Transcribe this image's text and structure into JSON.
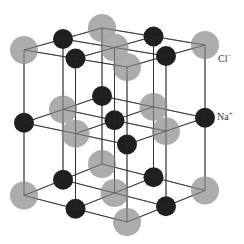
{
  "lattice": {
    "size": 3,
    "origin_back_top": [
      102,
      28
    ],
    "axis_a_left": [
      -39,
      11
    ],
    "axis_b_right": [
      51.5,
      8.5
    ],
    "axis_c_down": [
      0,
      68
    ],
    "perspective_c_extra": [
      0,
      0.035
    ]
  },
  "ions": {
    "chloride": {
      "name": "Cl",
      "charge": "−",
      "label": "Cl",
      "label_sup": "−",
      "color": "#a8a8a8",
      "radius": 14
    },
    "sodium": {
      "name": "Na",
      "charge": "+",
      "label": "Na",
      "label_sup": "+",
      "color": "#1f1f1f",
      "radius": 10
    }
  },
  "line_color": "#2a2a2a",
  "labels": {
    "cl": {
      "text": "Cl",
      "sup": "−",
      "x": 218,
      "y": 53
    },
    "na": {
      "text": "Na",
      "sup": "+",
      "x": 217,
      "y": 111
    }
  }
}
